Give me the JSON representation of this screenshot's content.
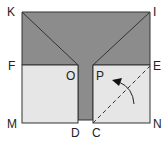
{
  "diagram": {
    "type": "geometry-folding",
    "labels": {
      "K": "K",
      "I": "I",
      "F": "F",
      "O": "O",
      "P": "P",
      "E": "E",
      "M": "M",
      "D": "D",
      "C": "C",
      "N": "N"
    },
    "colors": {
      "dark_region": "#8c8c8c",
      "light_region": "#e6e6e6",
      "stroke": "#333333"
    },
    "annotations": [
      "dashed fold line C-E",
      "curved arrow indicating fold direction"
    ]
  }
}
